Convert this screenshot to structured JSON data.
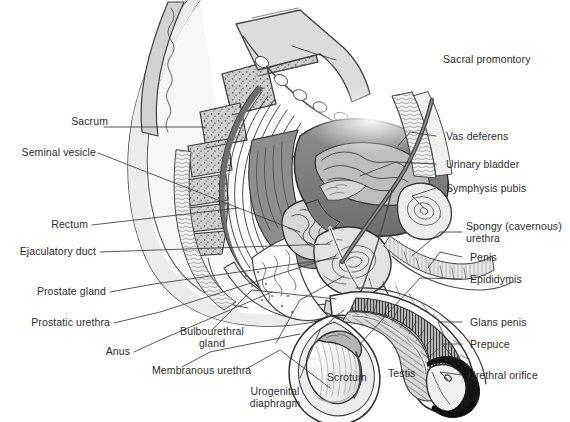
{
  "figure": {
    "background_color": "#ffffff",
    "text_color": "#2b2b2b",
    "line_color": "#3a3a3a"
  },
  "labels": {
    "sacral_promontory": "Sacral promontory",
    "sacrum": "Sacrum",
    "seminal_vesicle": "Seminal vesicle",
    "rectum": "Rectum",
    "ejaculatory_duct": "Ejaculatory duct",
    "prostate_gland": "Prostate gland",
    "prostatic_urethra": "Prostatic urethra",
    "anus": "Anus",
    "bulbourethral_gland_line1": "Bulbourethral",
    "bulbourethral_gland_line2": "gland",
    "membranous_urethra": "Membranous urethra",
    "urogenital_diaphragm_line1": "Urogenital",
    "urogenital_diaphragm_line2": "diaphragm",
    "scrotum": "Scrotum",
    "testis": "Testis",
    "vas_deferens": "Vas deferens",
    "urinary_bladder": "Urinary bladder",
    "symphysis_pubis": "Symphysis pubis",
    "spongy_urethra_line1": "Spongy (cavernous)",
    "spongy_urethra_line2": "urethra",
    "penis": "Penis",
    "epididymis": "Epididymis",
    "glans_penis": "Glans penis",
    "prepuce": "Prepuce",
    "urethral_orifice": "Urethral orifice"
  }
}
